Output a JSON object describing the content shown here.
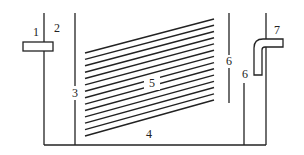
{
  "diagram": {
    "type": "sedimentation tank schematic (inclined plate settler)",
    "stroke_color": "#222222",
    "background": "#ffffff",
    "labels": [
      {
        "id": "1",
        "text": "1",
        "x": 36,
        "y": 36,
        "refers_to": "inlet box"
      },
      {
        "id": "2",
        "text": "2",
        "x": 57,
        "y": 32,
        "refers_to": "inlet wall"
      },
      {
        "id": "3",
        "text": "3",
        "x": 75,
        "y": 97,
        "refers_to": "baffle wall"
      },
      {
        "id": "4",
        "text": "4",
        "x": 149,
        "y": 138,
        "refers_to": "tank bottom"
      },
      {
        "id": "5",
        "text": "5",
        "x": 152,
        "y": 87,
        "refers_to": "inclined plates"
      },
      {
        "id": "6a",
        "text": "6",
        "x": 229,
        "y": 65,
        "refers_to": "upper baffle"
      },
      {
        "id": "6b",
        "text": "6",
        "x": 245,
        "y": 78,
        "refers_to": "lower baffle"
      },
      {
        "id": "7",
        "text": "7",
        "x": 277,
        "y": 34,
        "refers_to": "outlet pipe"
      }
    ],
    "plates": {
      "count": 14,
      "left_x": 85,
      "right_x": 214,
      "left_y_top": 53,
      "left_y_bottom": 136,
      "right_y_top": 19,
      "right_y_bottom": 100
    }
  }
}
